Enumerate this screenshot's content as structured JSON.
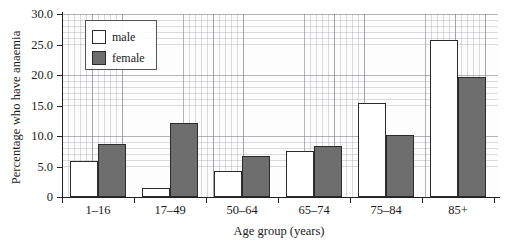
{
  "chart_data": {
    "type": "bar",
    "title": "",
    "xlabel": "Age group (years)",
    "ylabel": "Percentage who have anaemia",
    "categories": [
      "1–16",
      "17–49",
      "50–64",
      "65–74",
      "75–84",
      "85+"
    ],
    "series": [
      {
        "name": "male",
        "color": "#ffffff",
        "values": [
          5.9,
          1.5,
          4.3,
          7.6,
          15.4,
          25.7
        ]
      },
      {
        "name": "female",
        "color": "#6e6e6e",
        "values": [
          8.7,
          12.1,
          6.7,
          8.3,
          10.2,
          19.7
        ]
      }
    ],
    "ylim": [
      0,
      30
    ],
    "yticks": [
      "0",
      "5.0",
      "10.0",
      "15.0",
      "20.0",
      "25.0",
      "30.0"
    ],
    "ytick_values": [
      0,
      5,
      10,
      15,
      20,
      25,
      30
    ],
    "grid": true,
    "grid_style": "graph-paper-mesh",
    "legend_position": "top-left-inside"
  },
  "legend": {
    "items": [
      {
        "label": "male"
      },
      {
        "label": "female"
      }
    ]
  }
}
